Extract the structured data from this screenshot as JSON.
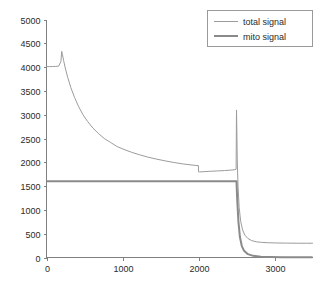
{
  "chart_data": {
    "type": "line",
    "title": "",
    "xlabel": "",
    "ylabel": "",
    "xlim": [
      0,
      3500
    ],
    "ylim": [
      0,
      5000
    ],
    "grid": false,
    "legend_position": "top-right",
    "xticks": [
      0,
      1000,
      2000,
      3000
    ],
    "xtick_labels": [
      "0",
      "1000",
      "2000",
      "3000"
    ],
    "yticks": [
      0,
      500,
      1000,
      1500,
      2000,
      2500,
      3000,
      3500,
      4000,
      4500,
      5000
    ],
    "ytick_labels": [
      "0",
      "500",
      "1000",
      "1500",
      "2000",
      "2500",
      "3000",
      "3500",
      "4000",
      "4500",
      "5000"
    ],
    "series": [
      {
        "name": "total signal",
        "color": "#9c9c9c",
        "x": [
          0,
          40,
          80,
          120,
          160,
          190,
          200,
          210,
          225,
          250,
          280,
          320,
          370,
          420,
          480,
          540,
          610,
          680,
          760,
          840,
          930,
          1020,
          1120,
          1220,
          1330,
          1440,
          1560,
          1680,
          1800,
          1900,
          1980,
          1999,
          2000,
          2010,
          2060,
          2140,
          2240,
          2340,
          2440,
          2480,
          2495,
          2500,
          2505,
          2510,
          2520,
          2535,
          2555,
          2580,
          2610,
          2650,
          2700,
          2760,
          2830,
          2920,
          3030,
          3160,
          3300,
          3420,
          3500
        ],
        "y": [
          4010,
          4010,
          4012,
          4015,
          4020,
          4120,
          4330,
          4260,
          4140,
          3960,
          3780,
          3570,
          3360,
          3180,
          3000,
          2860,
          2720,
          2610,
          2500,
          2420,
          2330,
          2270,
          2210,
          2160,
          2110,
          2070,
          2030,
          1995,
          1965,
          1945,
          1932,
          1930,
          1800,
          1798,
          1802,
          1810,
          1818,
          1826,
          1838,
          1845,
          1855,
          3100,
          2600,
          2050,
          1500,
          1050,
          760,
          580,
          470,
          400,
          355,
          330,
          318,
          310,
          305,
          302,
          300,
          300,
          300
        ]
      },
      {
        "name": "mito signal",
        "color": "#8a8a8a",
        "x": [
          0,
          300,
          700,
          1100,
          1500,
          1900,
          2200,
          2400,
          2480,
          2500,
          2510,
          2525,
          2545,
          2570,
          2600,
          2650,
          2720,
          2820,
          2950,
          3100,
          3280,
          3420,
          3500
        ],
        "y": [
          1600,
          1600,
          1600,
          1600,
          1600,
          1600,
          1600,
          1600,
          1600,
          1600,
          1200,
          760,
          430,
          240,
          140,
          70,
          35,
          18,
          10,
          6,
          4,
          3,
          3
        ]
      }
    ]
  },
  "legend": {
    "entries": [
      {
        "label": "total signal"
      },
      {
        "label": "mito signal"
      }
    ]
  },
  "colors": {
    "total_signal": "#9c9c9c",
    "mito_signal": "#8a8a8a",
    "axis": "#808080",
    "text": "#2b2b2b",
    "background": "#ffffff"
  }
}
